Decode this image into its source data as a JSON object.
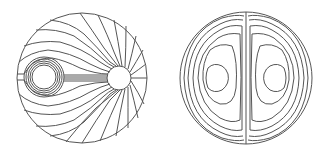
{
  "figure": {
    "panels": [
      {
        "id": "left",
        "description": "Field lines in a circular domain between a ring source (left) and a circular sink hole (right)",
        "domain_circle": {
          "cx": 82,
          "cy": 78,
          "r": 65
        },
        "source_rings": {
          "cx": 44,
          "cy": 77,
          "radii": [
            12,
            14,
            16,
            18,
            20
          ]
        },
        "sink_hole": {
          "cx": 119,
          "cy": 78,
          "r": 12
        }
      },
      {
        "id": "right",
        "description": "Two symmetric counter-rotating vortex cells separated by a vertical center line",
        "domain_circle": {
          "cx": 246,
          "cy": 78,
          "r": 66
        },
        "divider_x": 246,
        "vortex_centers": [
          {
            "cx": 213,
            "cy": 78
          },
          {
            "cx": 279,
            "cy": 78
          }
        ]
      }
    ],
    "colors": {
      "line": "#555555",
      "background": "#ffffff"
    }
  }
}
